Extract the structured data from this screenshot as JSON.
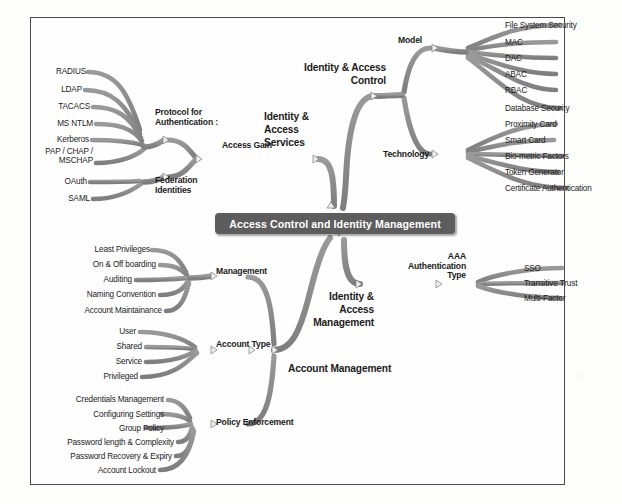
{
  "diagram": {
    "title": "Access Control and Identity Management",
    "type": "mind-map",
    "colors": {
      "center_node_fill": "#5d5d5d",
      "center_node_text": "#ffffff",
      "branch": "#8c8c8c",
      "branch_dark": "#6f6f6f",
      "label_text": "#1b1b1b",
      "frame_border": "#4a4a4a",
      "background": "#fefefe"
    }
  },
  "center": {
    "label": "Access Control and Identity Management"
  },
  "main_branches": [
    {
      "id": "identity-access-services",
      "label": "Identity &\nAccess\nServices",
      "side": "upper-left"
    },
    {
      "id": "identity-access-control",
      "label": "Identity & Access\nControl",
      "side": "upper-right"
    },
    {
      "id": "identity-access-management",
      "label": "Identity &\nAccess\nManagement",
      "side": "lower-right"
    },
    {
      "id": "account-management",
      "label": "Account Management",
      "side": "lower-left"
    }
  ],
  "sub_branches": {
    "protocol_for_authentication": {
      "label": "Protocol for\nAuthentication :",
      "leaves": [
        "RADIUS",
        "LDAP",
        "TACACS",
        "MS NTLM",
        "Kerberos",
        "PAP / CHAP /\nMSCHAP"
      ]
    },
    "federation_identities": {
      "label": "Federation\nIdentities",
      "leaves": [
        "OAuth",
        "SAML"
      ]
    },
    "access_gain": {
      "label": "Access Gain"
    },
    "model": {
      "label": "Model",
      "leaves": [
        "File System Security",
        "MAC",
        "DAC",
        "ABAC",
        "RBAC",
        "Database Security"
      ]
    },
    "technology": {
      "label": "Technology",
      "leaves": [
        "Proximity Card",
        "Smart Card",
        "Bio-metric Factors",
        "Token Generator",
        "Certificate Authentication"
      ]
    },
    "aaa_authentication_type": {
      "label": "AAA\nAuthentication\nType",
      "leaves": [
        "SSO",
        "Transitive Trust",
        "Multi-Factor"
      ]
    },
    "management": {
      "label": "Management",
      "leaves": [
        "Least Privileges",
        "On & Off boarding",
        "Auditing",
        "Naming Convention",
        "Account Maintainance"
      ]
    },
    "account_type": {
      "label": "Account Type",
      "leaves": [
        "User",
        "Shared",
        "Service",
        "Privileged"
      ]
    },
    "policy_enforcement": {
      "label": "Policy Enforcement",
      "leaves": [
        "Credentials Management",
        "Configuring Settings",
        "Group Policy",
        "Password length & Complexity",
        "Password Recovery & Expiry",
        "Account Lockout"
      ]
    }
  },
  "artifact": {
    "mark": "::"
  }
}
